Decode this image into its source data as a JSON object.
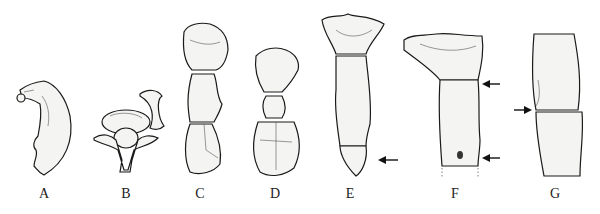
{
  "figure": {
    "panels": [
      {
        "id": "A",
        "label": "A",
        "x": 44
      },
      {
        "id": "B",
        "label": "B",
        "x": 126
      },
      {
        "id": "C",
        "label": "C",
        "x": 200
      },
      {
        "id": "D",
        "label": "D",
        "x": 275
      },
      {
        "id": "E",
        "label": "E",
        "x": 350
      },
      {
        "id": "F",
        "label": "F",
        "x": 455
      },
      {
        "id": "G",
        "label": "G",
        "x": 555
      }
    ],
    "arrows": [
      {
        "panel": "E",
        "direction": "left",
        "count": 1
      },
      {
        "panel": "F",
        "direction": "left",
        "count": 2
      },
      {
        "panel": "G",
        "direction": "right",
        "count": 1
      }
    ]
  }
}
